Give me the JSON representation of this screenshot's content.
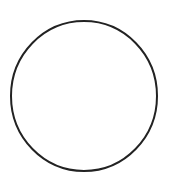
{
  "diagram": {
    "background": "#ffffff",
    "shapes": [
      {
        "type": "circle",
        "cx": 84,
        "cy": 96,
        "rx": 73,
        "ry": 75,
        "stroke": "#222222",
        "stroke_width": 2,
        "fill": "none"
      }
    ]
  }
}
